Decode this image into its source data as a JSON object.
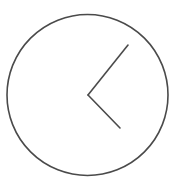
{
  "figure": {
    "description": "clock icon",
    "background": "#ffffff",
    "stroke_color": "#4a4a4a",
    "face": {
      "cx": 87.5,
      "cy": 95,
      "r": 80.5,
      "stroke_width": 1.6
    },
    "hands": [
      {
        "name": "upper-hand",
        "x1": 88,
        "y1": 95,
        "x2": 128,
        "y2": 45,
        "stroke_width": 1.6
      },
      {
        "name": "lower-hand",
        "x1": 88,
        "y1": 95,
        "x2": 120,
        "y2": 128,
        "stroke_width": 1.6
      }
    ]
  }
}
